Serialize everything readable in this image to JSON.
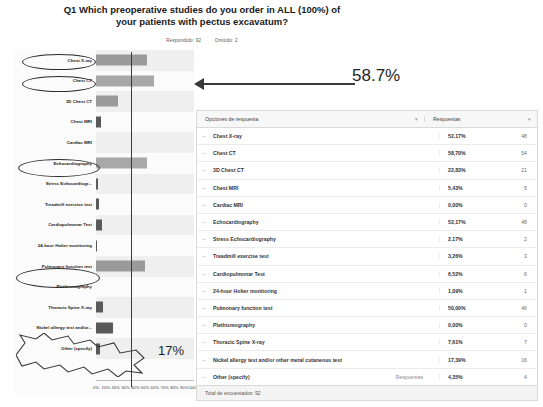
{
  "title": "Q1 Which preoperative studies do you order in ALL (100%) of your patients with pectus excavatum?",
  "meta": {
    "answered": "Respondido: 92",
    "skipped": "Omitido: 2"
  },
  "annotations": {
    "highlight_pct": "58.7%",
    "callout_pct": "17%"
  },
  "chart_data": {
    "type": "bar",
    "orientation": "horizontal",
    "title": "Q1 Which preoperative studies do you order in ALL (100%) of your patients with pectus excavatum?",
    "xlabel": "",
    "ylabel": "",
    "xlim": [
      0,
      100
    ],
    "grid": false,
    "xticks": [
      "0%",
      "10%",
      "20%",
      "30%",
      "40%",
      "50%",
      "60%",
      "70%",
      "80%",
      "90%",
      "100%"
    ],
    "reference_line": 50,
    "categories": [
      "Chest X-ray",
      "Chest CT",
      "3D Chest CT",
      "Chest MRI",
      "Cardiac MRI",
      "Echocardiography",
      "Stress Echocardiogr...",
      "Treadmill exercise test",
      "Cardiopulmonar Test",
      "24-hour Holter monitoring",
      "Pulmonary function test",
      "Plethismography",
      "Thoracic Spine X-ray",
      "Nickel allergy test and/or...",
      "Other (specify)"
    ],
    "values": [
      52.17,
      58.7,
      22.83,
      5.43,
      0.0,
      52.17,
      2.17,
      3.26,
      6.52,
      1.09,
      50.0,
      0.0,
      7.61,
      17.39,
      4.35
    ],
    "counts": [
      48,
      54,
      21,
      5,
      0,
      48,
      2,
      3,
      6,
      1,
      46,
      0,
      7,
      16,
      4
    ],
    "circled_categories": [
      "Chest X-ray",
      "Chest CT",
      "Echocardiography",
      "Pulmonary function test",
      "Nickel allergy test and/or..."
    ]
  },
  "table": {
    "headers": {
      "options": "Opciones de respuesta",
      "responses": "Respuestas"
    },
    "inline_label": "Respuestas",
    "rows": [
      {
        "option": "Chest X-ray",
        "pct": "52,17%",
        "count": "48"
      },
      {
        "option": "Chest CT",
        "pct": "58,70%",
        "count": "54"
      },
      {
        "option": "3D Chest CT",
        "pct": "22,83%",
        "count": "21"
      },
      {
        "option": "Chest MRI",
        "pct": "5,43%",
        "count": "5"
      },
      {
        "option": "Cardiac MRI",
        "pct": "0,00%",
        "count": "0"
      },
      {
        "option": "Echocardiography",
        "pct": "52,17%",
        "count": "48"
      },
      {
        "option": "Stress Echocardiography",
        "pct": "2,17%",
        "count": "2"
      },
      {
        "option": "Treadmill exercise test",
        "pct": "3,26%",
        "count": "3"
      },
      {
        "option": "Cardiopulmonar Test",
        "pct": "6,52%",
        "count": "6"
      },
      {
        "option": "24-hour Holter monitoring",
        "pct": "1,09%",
        "count": "1"
      },
      {
        "option": "Pulmonary function test",
        "pct": "50,00%",
        "count": "46"
      },
      {
        "option": "Plethismography",
        "pct": "0,00%",
        "count": "0"
      },
      {
        "option": "Thoracic Spine X-ray",
        "pct": "7,61%",
        "count": "7"
      },
      {
        "option": "Nickel allergy test and/or other metal cutaneous test",
        "pct": "17,39%",
        "count": "16"
      },
      {
        "option": "Other (specify)",
        "pct": "4,35%",
        "count": "4"
      }
    ],
    "footer": "Total de encuestados: 92"
  }
}
